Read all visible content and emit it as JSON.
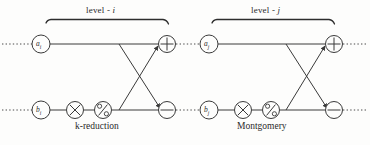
{
  "figure": {
    "stroke_color": "#3a3a3a",
    "text_color": "#2a2a2a",
    "background_color": "#fdfdfc"
  },
  "blocks": [
    {
      "id": "level-i",
      "level_label_prefix": "level",
      "level_label_dash": "-",
      "level_label_index": "i",
      "level_label_full": "level - i",
      "reduction_label": "k-reduction",
      "top_input": {
        "base": "a",
        "sub": "i",
        "full": "a_i"
      },
      "bottom_input": {
        "base": "b",
        "sub": "i",
        "full": "b_i"
      },
      "ops": [
        {
          "name": "multiply",
          "glyph": "×"
        },
        {
          "name": "modulo",
          "glyph": "%"
        },
        {
          "name": "add",
          "glyph": "+"
        },
        {
          "name": "subtract",
          "glyph": "−"
        }
      ]
    },
    {
      "id": "level-j",
      "level_label_prefix": "level",
      "level_label_dash": "-",
      "level_label_index": "j",
      "level_label_full": "level - j",
      "reduction_label": "Montgomery",
      "top_input": {
        "base": "a",
        "sub": "j",
        "full": "a_j"
      },
      "bottom_input": {
        "base": "b",
        "sub": "j",
        "full": "b_j"
      },
      "ops": [
        {
          "name": "multiply",
          "glyph": "×"
        },
        {
          "name": "modulo",
          "glyph": "%"
        },
        {
          "name": "add",
          "glyph": "+"
        },
        {
          "name": "subtract",
          "glyph": "−"
        }
      ]
    }
  ]
}
